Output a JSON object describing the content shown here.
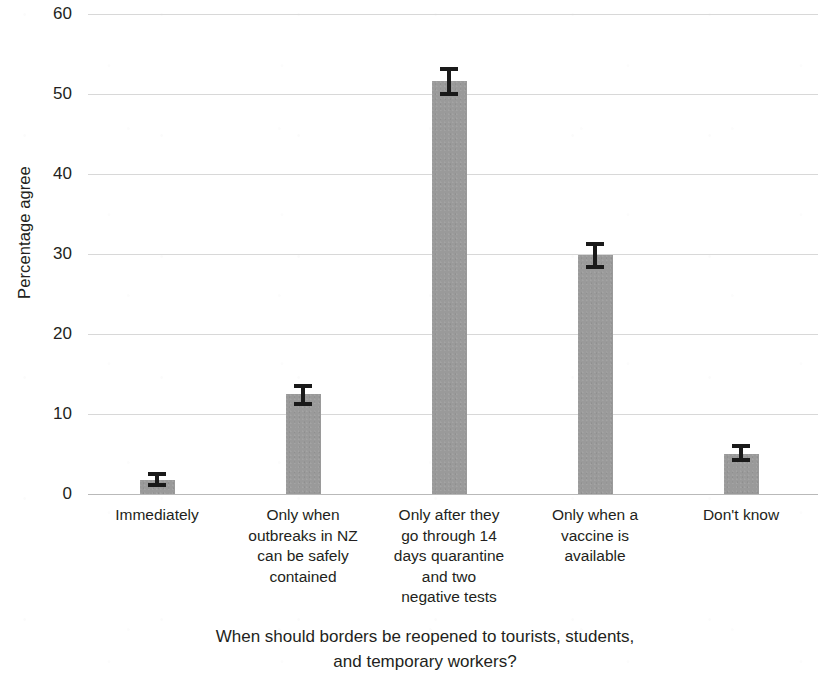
{
  "chart_data": {
    "type": "bar",
    "title": "",
    "xlabel": "When should borders be reopened to tourists, students,\nand temporary workers?",
    "ylabel": "Percentage agree",
    "ylim": [
      0,
      60
    ],
    "ytick_labels": [
      "0",
      "10",
      "20",
      "30",
      "40",
      "50",
      "60"
    ],
    "ytick_values": [
      0,
      10,
      20,
      30,
      40,
      50,
      60
    ],
    "grid": true,
    "legend": "none",
    "bar_color": "#9a9a9a",
    "errorbar_color": "#1a1a1a",
    "categories": [
      "Immediately",
      "Only when\noutbreaks in NZ\ncan be safely\ncontained",
      "Only after they\ngo through 14\ndays quarantine\nand two\nnegative tests",
      "Only when  a\nvaccine is\navailable",
      "Don't know"
    ],
    "values": [
      1.7,
      12.5,
      51.6,
      29.9,
      5.0
    ],
    "error_low": [
      0.9,
      11.0,
      49.8,
      28.1,
      4.0
    ],
    "error_high": [
      2.7,
      13.8,
      53.4,
      31.5,
      6.3
    ]
  }
}
